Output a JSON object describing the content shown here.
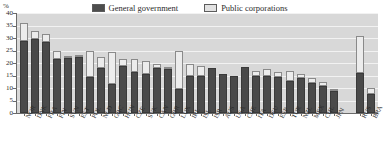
{
  "axis": {
    "unit_label": "%",
    "yticks": [
      0,
      5,
      10,
      15,
      20,
      25,
      30,
      35,
      40
    ],
    "ylim": [
      0,
      40
    ]
  },
  "legend": {
    "items": [
      {
        "label": "General government",
        "swatch": "dark-square-icon",
        "color": "#4a4a4a"
      },
      {
        "label": "Public corporations",
        "swatch": "light-square-icon",
        "color": "#ececec"
      }
    ]
  },
  "chart_data": {
    "type": "bar",
    "title": "",
    "subtitle": "",
    "xlabel": "",
    "ylabel": "%",
    "ylim": [
      0,
      40
    ],
    "grid": true,
    "stacked": true,
    "legend_position": "top-center",
    "categories": [
      "NOR",
      "DNK",
      "FRA",
      "FIN",
      "SVN",
      "EST",
      "POL",
      "NLD",
      "GRC",
      "HUN",
      "CZE",
      "SVK",
      "CAN",
      "GBR",
      "LUX",
      "IRL",
      "ISL",
      "ISR",
      "AUS",
      "USA",
      "CHE",
      "ITA",
      "DEU",
      "ESP",
      "TUR",
      "NZL",
      "MEX",
      "CHL",
      "JPN",
      "RUS",
      "BRA"
    ],
    "group_break_after": "JPN",
    "series": [
      {
        "name": "General government",
        "color": "#4a4a4a",
        "values": [
          29.0,
          29.5,
          28.5,
          21.5,
          22.0,
          22.5,
          14.5,
          18.0,
          11.5,
          19.0,
          16.5,
          15.5,
          18.0,
          17.5,
          9.5,
          15.0,
          15.0,
          18.0,
          15.5,
          15.0,
          18.5,
          15.0,
          15.0,
          14.5,
          13.0,
          14.0,
          12.0,
          11.0,
          9.0,
          16.0,
          7.5
        ]
      },
      {
        "name": "Public corporations",
        "color": "#ececec",
        "values": [
          7.0,
          3.5,
          3.0,
          3.5,
          1.0,
          0.5,
          10.5,
          4.5,
          13.0,
          2.5,
          5.0,
          5.5,
          1.5,
          0.5,
          15.5,
          4.5,
          4.0,
          0.0,
          0.0,
          0.0,
          0.0,
          2.0,
          2.5,
          2.0,
          4.0,
          1.5,
          2.0,
          1.5,
          0.5,
          15.0,
          2.5
        ]
      }
    ],
    "totals": [
      36.0,
      33.0,
      31.5,
      25.0,
      23.0,
      23.0,
      25.0,
      22.5,
      24.5,
      21.5,
      21.5,
      21.0,
      19.5,
      18.0,
      25.0,
      19.5,
      19.0,
      18.0,
      15.5,
      15.0,
      18.5,
      17.0,
      17.5,
      16.5,
      17.0,
      15.5,
      14.0,
      12.5,
      9.5,
      31.0,
      10.0
    ]
  }
}
